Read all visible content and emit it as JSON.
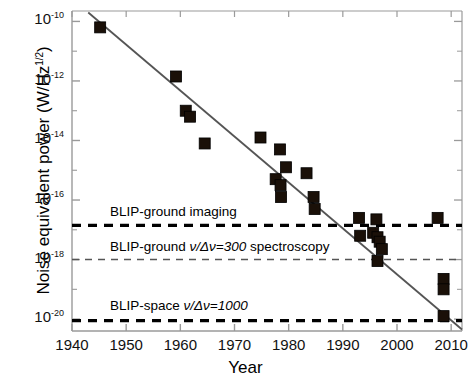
{
  "chart_data": {
    "type": "scatter",
    "title": "",
    "xlabel": "Year",
    "ylabel": "Noise equivalent power (W/Hz¹ᐟ²)",
    "ylabel_plain": "Noise equivalent power (W/Hz1/2)",
    "xlim": [
      1940,
      2012
    ],
    "ylim_exponent": [
      -20.4,
      -9.65
    ],
    "yscale": "log",
    "xticks": [
      1940,
      1950,
      1960,
      1970,
      1980,
      1990,
      2000,
      2010
    ],
    "xticklabels": [
      "1940",
      "1950",
      "1960",
      "1970",
      "1980",
      "1990",
      "2000",
      "2010"
    ],
    "yticks_exponent": [
      -10,
      -12,
      -14,
      -16,
      -18,
      -20
    ],
    "yticklabels": [
      "10",
      "10",
      "10",
      "10",
      "10",
      "10"
    ],
    "yticklabel_exponents": [
      "-10",
      "-12",
      "-14",
      "-16",
      "-18",
      "-20"
    ],
    "grid": false,
    "legend": "none",
    "marker": "filled-square",
    "marker_color": "#1a1008",
    "series": [
      {
        "name": "Detector NEP measurements",
        "points": [
          {
            "x": 1945.2,
            "y_exp": -10.2
          },
          {
            "x": 1959.2,
            "y_exp": -11.85
          },
          {
            "x": 1961.0,
            "y_exp": -13.0
          },
          {
            "x": 1961.8,
            "y_exp": -13.2
          },
          {
            "x": 1964.5,
            "y_exp": -14.1
          },
          {
            "x": 1974.8,
            "y_exp": -13.9
          },
          {
            "x": 1978.4,
            "y_exp": -14.3
          },
          {
            "x": 1979.5,
            "y_exp": -14.9
          },
          {
            "x": 1977.6,
            "y_exp": -15.3
          },
          {
            "x": 1978.5,
            "y_exp": -15.5
          },
          {
            "x": 1978.6,
            "y_exp": -15.9
          },
          {
            "x": 1983.3,
            "y_exp": -15.1
          },
          {
            "x": 1984.6,
            "y_exp": -15.9
          },
          {
            "x": 1984.8,
            "y_exp": -16.3
          },
          {
            "x": 1993.0,
            "y_exp": -16.6
          },
          {
            "x": 1996.2,
            "y_exp": -16.65
          },
          {
            "x": 1993.2,
            "y_exp": -17.2
          },
          {
            "x": 1995.6,
            "y_exp": -17.1
          },
          {
            "x": 1996.4,
            "y_exp": -17.25
          },
          {
            "x": 1996.8,
            "y_exp": -17.4
          },
          {
            "x": 1997.2,
            "y_exp": -17.65
          },
          {
            "x": 1996.4,
            "y_exp": -18.05
          },
          {
            "x": 2007.5,
            "y_exp": -16.6
          },
          {
            "x": 2008.6,
            "y_exp": -18.65
          },
          {
            "x": 2008.6,
            "y_exp": -19.0
          },
          {
            "x": 2008.6,
            "y_exp": -19.9
          }
        ]
      }
    ],
    "trendline": {
      "name": "Exponential improvement fit",
      "x0": 1943.0,
      "y0_exp": -9.7,
      "x1": 2012.0,
      "y1_exp": -20.35
    },
    "reference_lines": [
      {
        "label": "BLIP-ground imaging",
        "y_exp": -16.85,
        "style": "dashed",
        "weight": "thick",
        "label_x": 1947,
        "label_y_exp": -16.45
      },
      {
        "label_parts": {
          "pre": "BLIP-ground ",
          "nu": "ν/Δν=300",
          "post": " spectroscopy"
        },
        "label": "BLIP-ground ν/Δν=300 spectroscopy",
        "y_exp": -18.0,
        "style": "dashed",
        "weight": "thin",
        "label_x": 1947,
        "label_y_exp": -17.6
      },
      {
        "label_parts": {
          "pre": "BLIP-space ",
          "nu": "ν/Δν=1000",
          "post": ""
        },
        "label": "BLIP-space ν/Δν=1000",
        "y_exp": -20.05,
        "style": "dashed",
        "weight": "thick",
        "label_x": 1947,
        "label_y_exp": -19.6
      }
    ],
    "colors": {
      "axis": "#9a9a9a",
      "line": "#555555",
      "marker": "#1a1008",
      "dashed": "#000000",
      "dashed_thin": "#555555",
      "text": "#000000",
      "background": "#ffffff"
    }
  },
  "axes": {
    "y_title": "Noise equivalent power (W/Hz",
    "y_title_sup": "1/2",
    "y_title_tail": ")",
    "x_title": "Year"
  },
  "ticks": {
    "x": [
      "1940",
      "1950",
      "1960",
      "1970",
      "1980",
      "1990",
      "2000",
      "2010"
    ],
    "y_base": "10",
    "y_exp": [
      "-10",
      "-12",
      "-14",
      "-16",
      "-18",
      "-20"
    ]
  },
  "annotations": {
    "blip_ground_imaging": "BLIP-ground imaging",
    "blip_ground_spect_pre": "BLIP-ground ",
    "blip_ground_spect_nu": "ν/Δν=300",
    "blip_ground_spect_post": " spectroscopy",
    "blip_space_pre": "BLIP-space ",
    "blip_space_nu": "ν/Δν=1000"
  }
}
